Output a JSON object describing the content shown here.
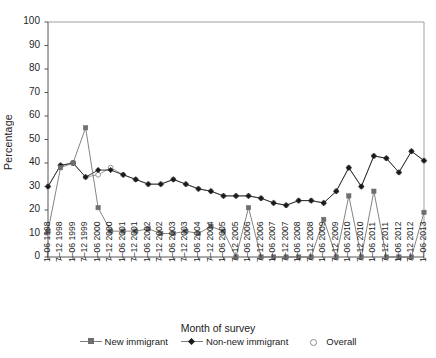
{
  "chart_data": {
    "type": "line",
    "title": "",
    "xlabel": "Month of survey",
    "ylabel": "Percentage",
    "ylim": [
      0,
      100
    ],
    "yticks": [
      0,
      10,
      20,
      30,
      40,
      50,
      60,
      70,
      80,
      90,
      100
    ],
    "grid": false,
    "legend_position": "bottom",
    "categories": [
      "1–06 1998",
      "7–12 1998",
      "1–06 1999",
      "7–12 1999",
      "1–06 2000",
      "7–12 2000",
      "1–06 2001",
      "7–12 2001",
      "1–06 2002",
      "7–12 2002",
      "1–06 2003",
      "7–12 2003",
      "1–06 2004",
      "7–12 2004",
      "1–06 2005",
      "7–12 2005",
      "1–06 2006",
      "7–12 2006",
      "1–06 2007",
      "7–12 2007",
      "1–06 2008",
      "7–12 2008",
      "1–06 2009",
      "7–12 2009",
      "1–06 2010",
      "7–12 2010",
      "1–06 2011",
      "7–12 2011",
      "1–06 2012",
      "7–12 2012",
      "1–06 2013"
    ],
    "series": [
      {
        "name": "New immigrant",
        "marker": "square",
        "color": "#6e6e6e",
        "values": [
          11,
          38,
          40,
          55,
          21,
          11,
          11,
          11,
          12,
          10,
          10,
          11,
          10,
          13,
          11,
          0,
          21,
          0,
          0,
          0,
          0,
          0,
          16,
          0,
          26,
          0,
          28,
          0,
          0,
          0,
          19
        ]
      },
      {
        "name": "Non-new immigrant",
        "marker": "diamond",
        "color": "#1a1a1a",
        "values": [
          30,
          39,
          40,
          34,
          37,
          37,
          35,
          33,
          31,
          31,
          33,
          31,
          29,
          28,
          26,
          26,
          26,
          25,
          23,
          22,
          24,
          24,
          23,
          28,
          38,
          30,
          43,
          42,
          36,
          45,
          41
        ]
      },
      {
        "name": "Overall",
        "marker": "circle-open",
        "color": "#8a8a8a",
        "values": [
          30,
          39,
          40,
          34,
          35,
          38,
          35,
          33,
          31,
          31,
          33,
          31,
          29,
          28,
          26,
          26,
          26,
          25,
          23,
          22,
          24,
          24,
          23,
          28,
          38,
          30,
          43,
          42,
          36,
          45,
          41
        ]
      }
    ]
  },
  "legend": {
    "entries": [
      {
        "label": "New immigrant",
        "marker": "square-marker-icon"
      },
      {
        "label": "Non-new immigrant",
        "marker": "diamond-marker-icon"
      },
      {
        "label": "Overall",
        "marker": "circle-marker-icon"
      }
    ]
  },
  "axes": {
    "y_title": "Percentage",
    "x_title": "Month of survey"
  }
}
